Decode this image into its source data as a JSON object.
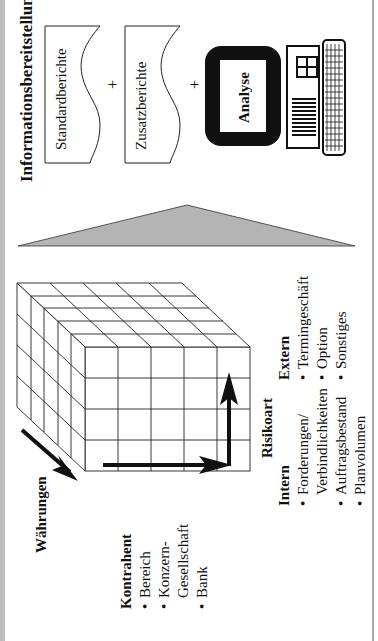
{
  "title": "Informationsbereitstellung",
  "reports": [
    {
      "label": "Standardberichte"
    },
    {
      "label": "Zusatzberichte"
    }
  ],
  "plus_sign": "+",
  "analysis": {
    "label": "Analyse",
    "icon": "computer-icon"
  },
  "triangle": {
    "icon": "triangle-arrow-icon",
    "color": "#b4b4b4"
  },
  "cube": {
    "icon": "data-cube-icon",
    "grid": {
      "columns": 5,
      "rows": 4,
      "depth": 5
    }
  },
  "axes": {
    "currencies": {
      "label": "Währungen"
    },
    "counterparty": {
      "label": "Kontrahent",
      "items": [
        "Bereich",
        "Konzern-",
        "Gesellschaft",
        "Bank"
      ]
    },
    "risk_type": {
      "label": "Risikoart",
      "intern": {
        "label": "Intern",
        "items": [
          "Forderungen/",
          "Verbindlichkeiten",
          "Auftragsbestand",
          "Planvolumen"
        ]
      },
      "extern": {
        "label": "Extern",
        "items": [
          "Termingeschäft",
          "Option",
          "Sonstiges"
        ]
      }
    }
  },
  "bullet": "•",
  "colors": {
    "background": "#ffffff",
    "ink": "#111111",
    "border": "#bdbdbd"
  }
}
